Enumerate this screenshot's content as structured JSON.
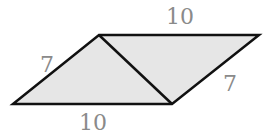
{
  "diagram": {
    "type": "parallelogram-with-diagonal",
    "shape": "parallelogram",
    "fill_color": "#e6e6e6",
    "stroke_color": "#111111",
    "label_color": "#8a8a8a",
    "vertices": {
      "bottom_left": [
        13,
        104
      ],
      "top_left": [
        99,
        35
      ],
      "top_right": [
        259,
        35
      ],
      "bottom_right": [
        172,
        104
      ]
    },
    "diagonal": {
      "from": "top_left",
      "to": "bottom_right"
    },
    "labels": {
      "top_side": "10",
      "bottom_side": "10",
      "left_side": "7",
      "right_side": "7"
    }
  }
}
